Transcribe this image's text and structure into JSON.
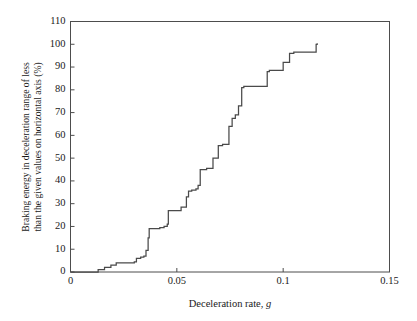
{
  "chart_data": {
    "type": "line",
    "title": "",
    "subtitle": "",
    "xlabel": "Deceleration rate, g",
    "xlabel_plain": "Deceleration rate,",
    "xlabel_italic": "g",
    "ylabel": "Braking energy in deceleration range of less than the given values on horizontal axis (%)",
    "ylabel_lines": [
      "Braking energy in deceleration range of less",
      "than the given values on horizontal axis (%)"
    ],
    "xlim": [
      0,
      0.15
    ],
    "ylim": [
      0,
      110
    ],
    "xticks": [
      0,
      0.05,
      0.1,
      0.15
    ],
    "xtick_labels": [
      "0",
      "0.05",
      "0.1",
      "0.15"
    ],
    "yticks": [
      0,
      10,
      20,
      30,
      40,
      50,
      60,
      70,
      80,
      90,
      100,
      110
    ],
    "ytick_labels": [
      "0",
      "10",
      "20",
      "30",
      "40",
      "50",
      "60",
      "70",
      "80",
      "90",
      "100",
      "110"
    ],
    "grid": false,
    "legend": false,
    "legend_position": "none",
    "line_color": "#4a4a4a",
    "axis_color": "#4d4d4d",
    "background_color": "#ffffff",
    "series": [
      {
        "name": "Cumulative braking energy",
        "step": "post",
        "x": [
          0.0,
          0.012,
          0.013,
          0.015,
          0.016,
          0.0175,
          0.019,
          0.0205,
          0.0215,
          0.0255,
          0.03,
          0.031,
          0.033,
          0.0345,
          0.0355,
          0.0365,
          0.037,
          0.0395,
          0.042,
          0.044,
          0.0455,
          0.046,
          0.048,
          0.052,
          0.0545,
          0.0555,
          0.057,
          0.059,
          0.06,
          0.061,
          0.064,
          0.066,
          0.067,
          0.0695,
          0.0705,
          0.0715,
          0.0745,
          0.076,
          0.0775,
          0.079,
          0.0805,
          0.0815,
          0.0825,
          0.091,
          0.0925,
          0.0935,
          0.0985,
          0.1,
          0.103,
          0.105,
          0.106,
          0.114,
          0.1155,
          0.116
        ],
        "y": [
          0.0,
          0.0,
          1.0,
          1.0,
          2.0,
          2.0,
          3.0,
          3.0,
          4.0,
          4.0,
          4.5,
          6.0,
          6.5,
          7.0,
          9.5,
          15.0,
          19.0,
          19.0,
          19.5,
          20.0,
          21.0,
          27.0,
          27.0,
          28.5,
          33.0,
          35.5,
          36.0,
          36.5,
          38.0,
          45.0,
          45.5,
          45.5,
          50.0,
          55.5,
          55.5,
          56.0,
          64.0,
          67.5,
          69.0,
          73.0,
          81.0,
          81.5,
          81.5,
          81.5,
          88.0,
          88.5,
          88.5,
          92.0,
          96.0,
          96.5,
          96.5,
          96.5,
          100.0,
          100.5
        ]
      }
    ],
    "annotations": []
  }
}
